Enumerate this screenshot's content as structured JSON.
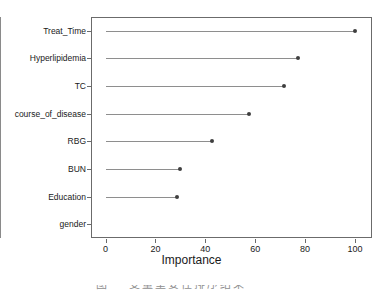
{
  "chart_data": {
    "type": "bar",
    "title": "",
    "subtitle": "",
    "xlabel": "Importance",
    "ylabel": "",
    "categories": [
      "Treat_Time",
      "Hyperlipidemia",
      "TC",
      "course_of_disease",
      "RBG",
      "BUN",
      "Education",
      "gender"
    ],
    "values": [
      100,
      77,
      71.5,
      57.5,
      42.5,
      30,
      28.5,
      0
    ],
    "xlim": [
      0,
      100
    ],
    "xticks": [
      0,
      20,
      40,
      60,
      80,
      100
    ],
    "xtick_labels": [
      "0",
      "20",
      "40",
      "60",
      "80",
      "100"
    ],
    "grid": false,
    "legend": false,
    "legend_position": "none",
    "orientation": "horizontal",
    "style": "lollipop-dotchart",
    "annotations": []
  },
  "colors": {
    "dot": "#3f3f3f",
    "stem": "#8e8e8e",
    "frame": "#6b6b6b",
    "zero_line": "#8a8a8a",
    "text": "#1a1a1a",
    "background": "#ffffff",
    "caption": "#8f8f8f"
  },
  "axis": {
    "x_title": "Importance",
    "tick_labels": [
      "0",
      "20",
      "40",
      "60",
      "80",
      "100"
    ]
  },
  "caption": {
    "text": "图    变量重要性排序结果"
  }
}
